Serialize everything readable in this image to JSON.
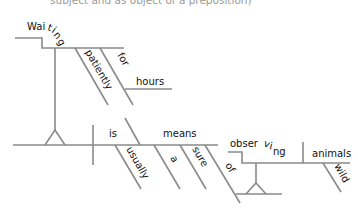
{
  "caption": "subject and as object of a preposition)",
  "colors": {
    "line": "#8a8a8a",
    "text": "#111111",
    "caption": "#9a9a9a",
    "background": "#ffffff"
  },
  "words": {
    "waiting_1": "Wai",
    "waiting_2": "t",
    "waiting_3": "i",
    "waiting_4": "n",
    "waiting_5": "g",
    "patiently": "patiently",
    "for": "for",
    "hours": "hours",
    "is": "is",
    "usually": "usually",
    "means": "means",
    "a": "a",
    "sure": "sure",
    "of": "of",
    "observing_1": "obser",
    "observing_2": "v",
    "observing_3": "i",
    "observing_4": "ng",
    "animals": "animals",
    "wild": "wild"
  }
}
